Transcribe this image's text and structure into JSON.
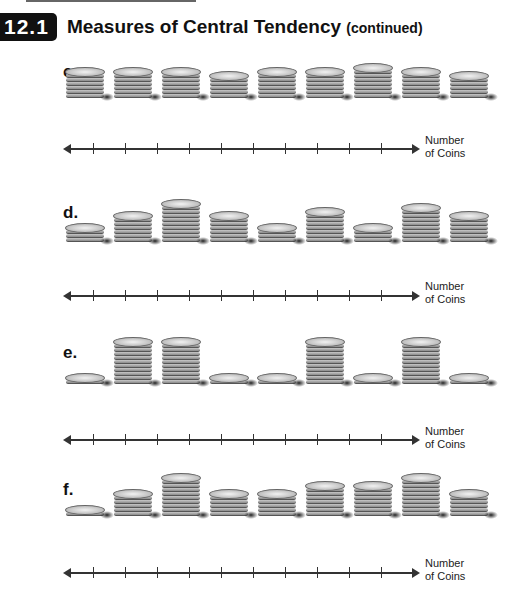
{
  "header": {
    "section_number": "12.1",
    "title": "Measures of Central Tendency",
    "subtitle": "(continued)"
  },
  "problems": [
    {
      "label": "c.",
      "stacks": [
        6,
        6,
        6,
        5,
        6,
        6,
        7,
        6,
        5
      ],
      "axis_label_1": "Number",
      "axis_label_2": "of Coins",
      "ticks": 10
    },
    {
      "label": "d.",
      "stacks": [
        3,
        6,
        9,
        6,
        3,
        7,
        3,
        8,
        6
      ],
      "axis_label_1": "Number",
      "axis_label_2": "of Coins",
      "ticks": 10
    },
    {
      "label": "e.",
      "stacks": [
        1,
        10,
        10,
        1,
        1,
        10,
        1,
        10,
        1
      ],
      "axis_label_1": "Number",
      "axis_label_2": "of Coins",
      "ticks": 10
    },
    {
      "label": "f.",
      "stacks": [
        1,
        5,
        9,
        5,
        5,
        7,
        7,
        9,
        5
      ],
      "axis_label_1": "Number",
      "axis_label_2": "of Coins",
      "ticks": 10
    }
  ],
  "colors": {
    "badge_bg": "#111111",
    "badge_text": "#ffffff",
    "axis": "#333333"
  }
}
